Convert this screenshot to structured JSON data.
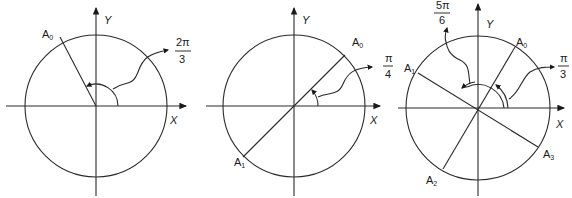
{
  "diagrams": [
    {
      "id": "panel-1",
      "axis_x_label": "X",
      "axis_y_label": "Y",
      "points": [
        {
          "name": "A",
          "sub": "0"
        }
      ],
      "angle_label": {
        "num": "2π",
        "den": "3"
      }
    },
    {
      "id": "panel-2",
      "axis_x_label": "X",
      "axis_y_label": "Y",
      "points": [
        {
          "name": "A",
          "sub": "0"
        },
        {
          "name": "A",
          "sub": "1"
        }
      ],
      "angle_label": {
        "num": "π",
        "den": "4"
      }
    },
    {
      "id": "panel-3",
      "axis_x_label": "X",
      "axis_y_label": "Y",
      "points": [
        {
          "name": "A",
          "sub": "0"
        },
        {
          "name": "A",
          "sub": "1"
        },
        {
          "name": "A",
          "sub": "2"
        },
        {
          "name": "A",
          "sub": "3"
        }
      ],
      "angle_labels": [
        {
          "num": "5π",
          "den": "6"
        },
        {
          "num": "π",
          "den": "3"
        }
      ]
    }
  ]
}
